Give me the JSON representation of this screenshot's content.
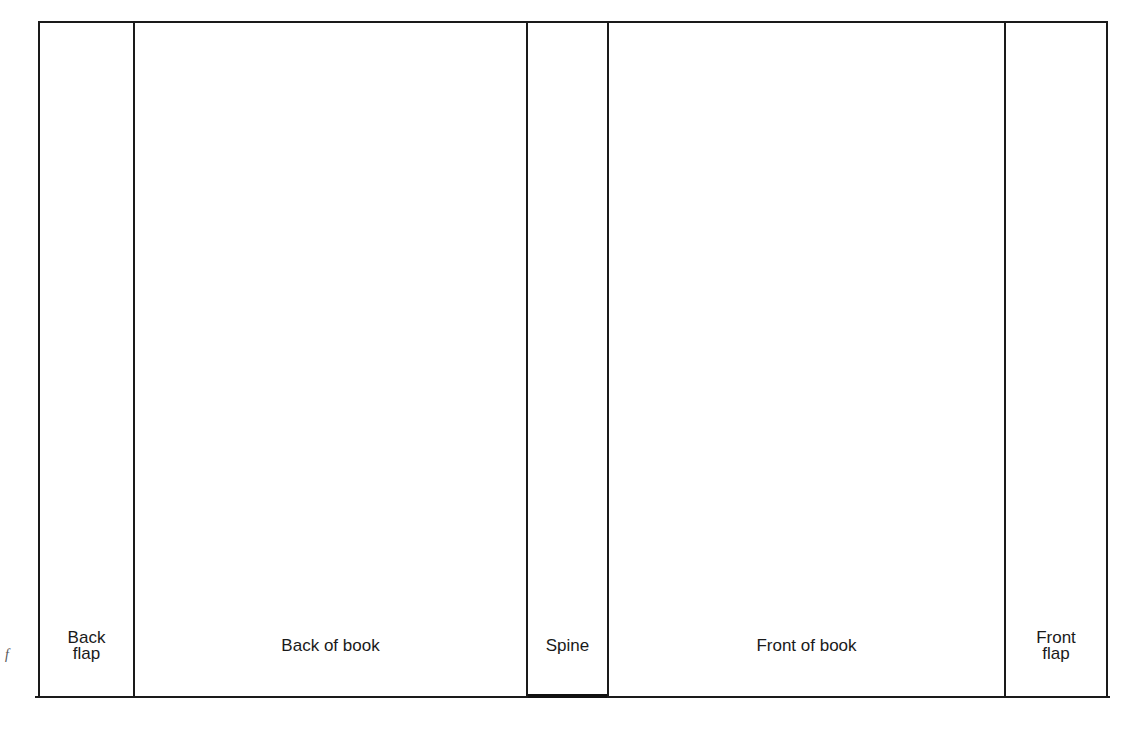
{
  "diagram": {
    "panels": [
      {
        "id": "back-flap",
        "line1": "Back",
        "line2": "flap"
      },
      {
        "id": "back-of-book",
        "label": "Back of book"
      },
      {
        "id": "spine",
        "label": "Spine"
      },
      {
        "id": "front-of-book",
        "label": "Front of book"
      },
      {
        "id": "front-flap",
        "line1": "Front",
        "line2": "flap"
      }
    ],
    "margin_fragment": "f"
  }
}
